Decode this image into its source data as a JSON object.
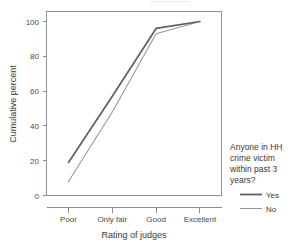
{
  "chart_data": {
    "type": "line",
    "title": "",
    "xlabel": "Rating of judges",
    "ylabel": "Cumulative percent",
    "categories": [
      "Poor",
      "Only fair",
      "Good",
      "Excellent"
    ],
    "xtick_labels": [
      "Poor",
      "Only fair",
      "Good",
      "Excellent"
    ],
    "ytick_labels": [
      "0",
      "20",
      "40",
      "60",
      "80",
      "100"
    ],
    "ytick_values": [
      0,
      20,
      40,
      60,
      80,
      100
    ],
    "ylim": [
      0,
      100
    ],
    "grid": false,
    "legend_position": "right",
    "legend_title": "Anyone in HH crime victim within past 3 years?",
    "series": [
      {
        "name": "Yes",
        "values": [
          19,
          57,
          96,
          100
        ],
        "color": "#5b6066",
        "line_width": "thick"
      },
      {
        "name": "No",
        "values": [
          8,
          48,
          93,
          100
        ],
        "color": "#95999e",
        "line_width": "thin"
      }
    ]
  },
  "axes": {
    "y_title": "Cumulative percent",
    "x_title": "Rating of judges",
    "y_ticks": [
      {
        "label": "100",
        "value": 100
      },
      {
        "label": "80",
        "value": 80
      },
      {
        "label": "60",
        "value": 60
      },
      {
        "label": "40",
        "value": 40
      },
      {
        "label": "20",
        "value": 20
      },
      {
        "label": "0",
        "value": 0
      }
    ],
    "x_ticks": [
      {
        "label": "Poor"
      },
      {
        "label": "Only fair"
      },
      {
        "label": "Good"
      },
      {
        "label": "Excellent"
      }
    ]
  },
  "legend": {
    "title_lines": [
      "Anyone in HH",
      "crime victim",
      "within past 3",
      "years?"
    ],
    "entries": [
      {
        "label": "Yes",
        "color": "#5b6066"
      },
      {
        "label": "No",
        "color": "#95999e"
      }
    ]
  }
}
